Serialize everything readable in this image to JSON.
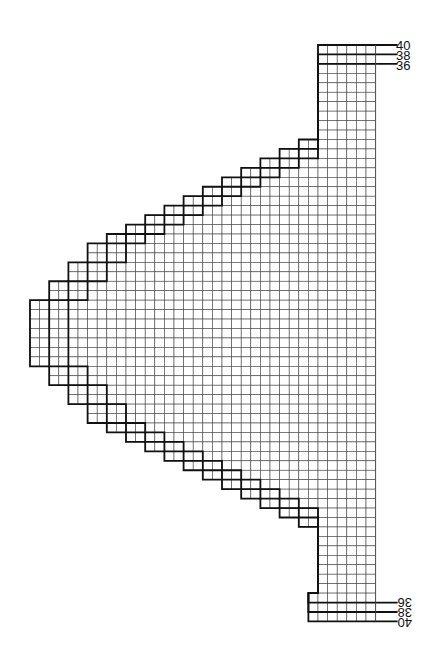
{
  "chart_title": "",
  "size_labels_top": [
    "40",
    "38",
    "36"
  ],
  "size_labels_bottom": [
    "36",
    "38",
    "40"
  ],
  "grid": {
    "columns": 36,
    "rows": 61
  },
  "line_color": "#111111",
  "grid_color": "#444444",
  "outlines": {
    "size_40_left_cols": [
      30,
      30,
      30,
      30,
      30,
      30,
      30,
      30,
      30,
      30,
      28,
      26,
      24,
      22,
      20,
      18,
      16,
      14,
      12,
      10,
      8,
      6,
      6,
      4,
      4,
      2,
      2,
      0,
      0,
      0,
      0,
      0,
      0,
      0,
      2,
      2,
      4,
      4,
      6,
      6,
      8,
      10,
      12,
      14,
      16,
      18,
      20,
      22,
      24,
      26,
      28,
      30,
      30,
      30,
      30,
      30,
      30,
      30,
      29,
      29,
      29
    ],
    "size_38_left_cols": [
      30,
      30,
      30,
      30,
      30,
      30,
      30,
      30,
      30,
      30,
      30,
      28,
      26,
      24,
      22,
      20,
      18,
      16,
      14,
      12,
      10,
      8,
      8,
      6,
      6,
      4,
      4,
      2,
      2,
      2,
      2,
      2,
      2,
      2,
      4,
      4,
      6,
      6,
      8,
      8,
      10,
      12,
      14,
      16,
      18,
      20,
      22,
      24,
      26,
      28,
      30,
      30,
      30,
      30,
      30,
      30,
      30,
      30,
      29,
      29,
      29
    ],
    "size_36_left_cols": [
      30,
      30,
      30,
      30,
      30,
      30,
      30,
      30,
      30,
      30,
      30,
      30,
      28,
      26,
      24,
      22,
      20,
      18,
      16,
      14,
      12,
      10,
      10,
      8,
      8,
      6,
      6,
      4,
      4,
      4,
      4,
      4,
      4,
      4,
      6,
      6,
      8,
      8,
      10,
      10,
      12,
      14,
      16,
      18,
      20,
      22,
      24,
      26,
      28,
      30,
      30,
      30,
      30,
      30,
      30,
      30,
      30,
      30,
      29,
      29,
      29
    ]
  }
}
